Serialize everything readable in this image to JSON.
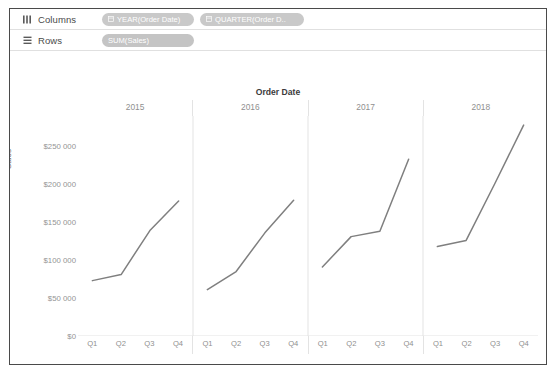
{
  "shelves": {
    "columns": {
      "icon": "columns-grid-icon",
      "label": "Columns",
      "pills": [
        {
          "icon": "calendar-icon",
          "label": "YEAR(Order Date)"
        },
        {
          "icon": "calendar-icon",
          "label": "QUARTER(Order D.."
        }
      ]
    },
    "rows": {
      "icon": "rows-list-icon",
      "label": "Rows",
      "pills": [
        {
          "icon": "",
          "label": "SUM(Sales)"
        }
      ]
    }
  },
  "chart_data": {
    "type": "line",
    "title": "Order Date",
    "xlabel": "",
    "ylabel": "Sales",
    "ylim": [
      0,
      290000
    ],
    "grid": false,
    "legend": false,
    "line_color": "#7f7f7f",
    "panel_labels": [
      "2015",
      "2016",
      "2017",
      "2018"
    ],
    "categories": [
      "Q1",
      "Q2",
      "Q3",
      "Q4"
    ],
    "ytick_labels": [
      "$250 000",
      "$200 000",
      "$150 000",
      "$100 000",
      "$50 000",
      "$0"
    ],
    "ytick_values": [
      250000,
      200000,
      150000,
      100000,
      50000,
      0
    ],
    "series": [
      {
        "name": "2015",
        "values": [
          73000,
          81000,
          139000,
          178000
        ]
      },
      {
        "name": "2016",
        "values": [
          61000,
          85000,
          136000,
          179000
        ]
      },
      {
        "name": "2017",
        "values": [
          91000,
          131000,
          138000,
          233000
        ]
      },
      {
        "name": "2018",
        "values": [
          118000,
          126000,
          201000,
          278000
        ]
      }
    ]
  }
}
